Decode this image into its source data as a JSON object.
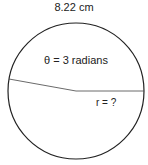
{
  "diagram": {
    "arc_length_label": "8.22 cm",
    "angle_label": "θ = 3 radians",
    "radius_label": "r = ?",
    "circle": {
      "cx": 76,
      "cy": 91,
      "r": 68,
      "stroke": "#222222"
    },
    "radius_lines": [
      {
        "x1": 76,
        "y1": 91,
        "x2": 144,
        "y2": 91
      },
      {
        "x1": 76,
        "y1": 91,
        "x2": 9,
        "y2": 79
      }
    ]
  }
}
